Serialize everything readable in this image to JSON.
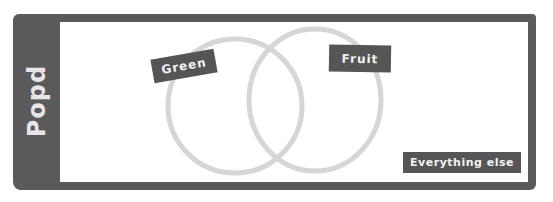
{
  "sidebar": {
    "title": "Popd"
  },
  "venn": {
    "sets": [
      {
        "label": "Green",
        "color": "#d6d6d6"
      },
      {
        "label": "Fruit",
        "color": "#d6d6d6"
      }
    ],
    "outside_label": "Everything else"
  },
  "colors": {
    "frame": "#5a5a5a",
    "label_bg": "#555555",
    "label_text": "#f2f2f2",
    "circle_stroke": "#d6d6d6"
  }
}
